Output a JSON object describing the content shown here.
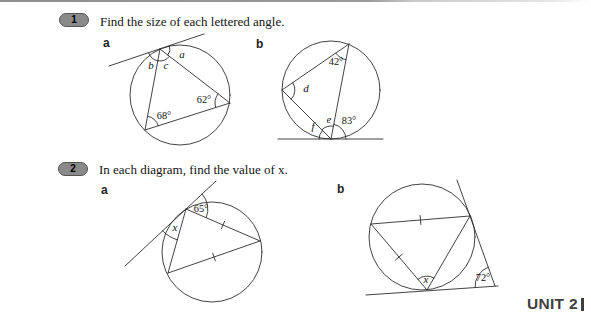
{
  "colors": {
    "badge_fill": "#8a8a8a",
    "badge_border": "#555555",
    "line": "#2e2e2e",
    "unit_text": "#3f3f3f"
  },
  "q1": {
    "number": "1",
    "prompt": "Find the size of each lettered angle.",
    "part_a": {
      "label": "a",
      "angles": {
        "a": "a",
        "b": "b",
        "c": "c",
        "v62": "62°",
        "v68": "68°"
      }
    },
    "part_b": {
      "label": "b",
      "angles": {
        "v42": "42°",
        "d": "d",
        "e": "e",
        "f": "f",
        "v83": "83°"
      }
    }
  },
  "q2": {
    "number": "2",
    "prompt": "In each diagram, find the value of x.",
    "part_a": {
      "label": "a",
      "angles": {
        "v65": "65°",
        "x": "x"
      }
    },
    "part_b": {
      "label": "b",
      "angles": {
        "x": "x",
        "v72": "72°"
      }
    }
  },
  "footer": {
    "unit_label": "UNIT 2"
  }
}
